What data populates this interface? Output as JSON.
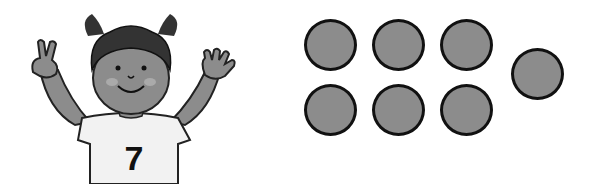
{
  "illustration": {
    "character": "girl-raising-hands",
    "shirt_number": "7",
    "fingers_left": 2,
    "fingers_right": 5
  },
  "dots": {
    "count": 7,
    "fill": "#8c8c8c",
    "stroke": "#111111",
    "positions": [
      {
        "x": 330,
        "y": 45
      },
      {
        "x": 398,
        "y": 45
      },
      {
        "x": 466,
        "y": 45
      },
      {
        "x": 330,
        "y": 110
      },
      {
        "x": 398,
        "y": 110
      },
      {
        "x": 466,
        "y": 110
      },
      {
        "x": 537,
        "y": 74
      }
    ]
  }
}
